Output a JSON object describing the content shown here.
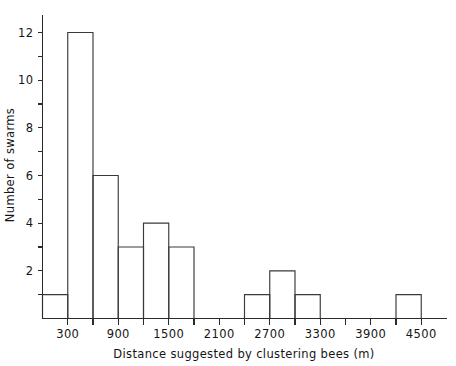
{
  "chart_data": {
    "type": "bar",
    "title": "",
    "subtitle": "",
    "xlabel": "Distance suggested by clustering bees   (m)",
    "ylabel": "Number of swarms",
    "grid": false,
    "legend": null,
    "bin_width": 300,
    "xlim": [
      0,
      4800
    ],
    "ylim": [
      0,
      13
    ],
    "x_major_ticks": [
      300,
      900,
      1500,
      2100,
      2700,
      3300,
      3900,
      4500
    ],
    "x_major_tick_labels": [
      "300",
      "900",
      "1500",
      "2100",
      "2700",
      "3300",
      "3900",
      "4500"
    ],
    "x_minor_ticks": [
      600,
      1200,
      1800,
      2400,
      3000,
      3600,
      4200
    ],
    "y_major_ticks": [
      2,
      4,
      6,
      8,
      10,
      12
    ],
    "y_major_tick_labels": [
      "2",
      "4",
      "6",
      "8",
      "10",
      "12"
    ],
    "y_minor_ticks": [
      1,
      3,
      5,
      7,
      9,
      11,
      13
    ],
    "bin_edges": [
      0,
      300,
      600,
      900,
      1200,
      1500,
      1800,
      2100,
      2400,
      2700,
      3000,
      3300,
      3600,
      3900,
      4200,
      4500,
      4800
    ],
    "categories": [
      "0-300",
      "300-600",
      "600-900",
      "900-1200",
      "1200-1500",
      "1500-1800",
      "1800-2100",
      "2100-2400",
      "2400-2700",
      "2700-3000",
      "3000-3300",
      "3300-3600",
      "3600-3900",
      "3900-4200",
      "4200-4500",
      "4500-4800"
    ],
    "values": [
      1,
      12,
      6,
      3,
      4,
      3,
      0,
      0,
      1,
      2,
      1,
      0,
      0,
      0,
      1,
      0
    ],
    "series": [
      {
        "name": "Number of swarms",
        "values": [
          1,
          12,
          6,
          3,
          4,
          3,
          0,
          0,
          1,
          2,
          1,
          0,
          0,
          0,
          1,
          0
        ]
      }
    ],
    "colors": {
      "bar_stroke": "#3a3a3a",
      "bar_fill": "none",
      "axis": "#2b2b2b",
      "text": "#151515",
      "background": "#ffffff"
    }
  }
}
